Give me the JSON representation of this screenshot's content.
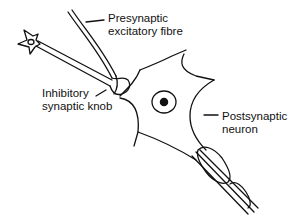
{
  "diagram": {
    "type": "neuron-synapse-illustration",
    "labels": {
      "presynaptic_fibre": {
        "line1": "Presynaptic",
        "line2": "excitatory fibre"
      },
      "inhibitory_knob": {
        "line1": "Inhibitory",
        "line2": "synaptic knob"
      },
      "postsynaptic_neuron": {
        "line1": "Postsynaptic",
        "line2": "neuron"
      }
    },
    "structures": [
      "presynaptic excitatory fibre",
      "inhibitory neuron (small star-shaped cell)",
      "inhibitory synaptic knob",
      "postsynaptic neuron cell body",
      "nucleus",
      "myelinated axon"
    ],
    "colors": {
      "stroke": "#111111",
      "background": "#ffffff"
    }
  }
}
